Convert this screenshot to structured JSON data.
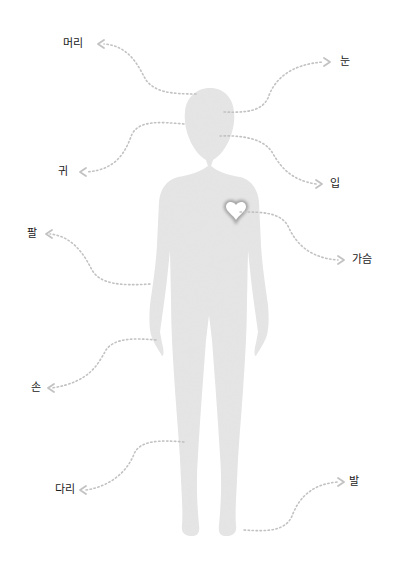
{
  "diagram": {
    "type": "body-parts-labelled-silhouette",
    "colors": {
      "silhouette": "#e6e6e6",
      "leader_line": "#c2c2c2",
      "heart_fill": "#ffffff",
      "heart_glow": "#9a9a9a",
      "label_text": "#1a1a1a"
    },
    "labels": {
      "head": "머리",
      "eye": "눈",
      "ear": "귀",
      "mouth": "입",
      "chest": "가슴",
      "arm": "팔",
      "hand": "손",
      "leg": "다리",
      "foot": "발"
    },
    "icons": {
      "heart": "heart-icon",
      "arrowhead": "chevron-arrow-icon"
    }
  }
}
